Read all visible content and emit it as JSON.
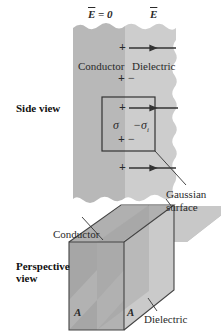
{
  "diagram": {
    "side_view": {
      "title": "Side view",
      "field_left": "E = 0",
      "field_left_vec": "E",
      "field_left_eq": "= 0",
      "field_right": "E",
      "region_left": "Conductor",
      "region_right": "Dielectric",
      "charge_plus": "+",
      "charge_minus": "−",
      "sigma": "σ",
      "sigma_induced": "−σ",
      "sigma_induced_sub": "i",
      "gaussian_label_line1": "Gaussian",
      "gaussian_label_line2": "surface"
    },
    "perspective_view": {
      "title_line1": "Perspective",
      "title_line2": "view",
      "conductor_label": "Conductor",
      "dielectric_label": "Dielectric",
      "area_left": "A",
      "area_right": "A"
    },
    "colors": {
      "conductor": "#b9b9b9",
      "dielectric": "#cfcfcf",
      "box_dark": "#9e9e9e",
      "box_light": "#c4c4c4",
      "line": "#333333"
    }
  }
}
